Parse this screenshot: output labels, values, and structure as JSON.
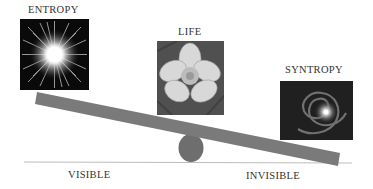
{
  "diagram": {
    "labels": {
      "entropy": "ENTROPY",
      "life": "LIFE",
      "syntropy": "SYNTROPY",
      "visible": "VISIBLE",
      "invisible": "INVISIBLE"
    },
    "images": {
      "entropy": "starburst-image",
      "life": "flower-image",
      "syntropy": "spiral-galaxy-image"
    },
    "colors": {
      "plank": "#7a7a7a",
      "pivot": "#6e6e6e",
      "ground": "#bdbdbd",
      "text": "#333333"
    }
  }
}
